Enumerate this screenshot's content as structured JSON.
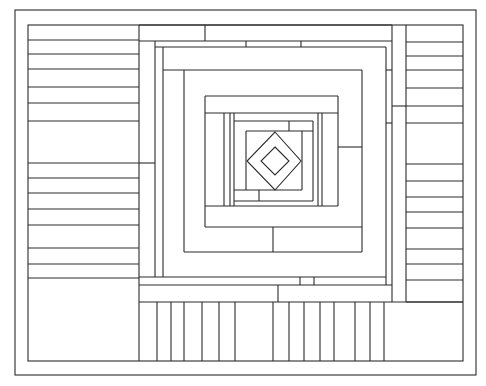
{
  "drawing": {
    "width": 486,
    "height": 386,
    "background": "#ffffff",
    "stroke": "#2a2a2a",
    "outer_border": {
      "x": 15,
      "y": 10,
      "w": 461,
      "h": 365
    },
    "inner_frame": {
      "x": 28,
      "y": 25,
      "w": 435,
      "h": 336
    },
    "left_panel": {
      "x1": 28,
      "x2": 139,
      "lines_y": [
        40,
        54,
        69,
        87,
        103,
        121,
        163,
        178,
        193,
        209,
        225,
        248,
        264,
        278
      ]
    },
    "right_panel": {
      "x1": 406,
      "x2": 463,
      "lines_y": [
        42,
        56,
        70,
        88,
        106,
        123,
        164,
        181,
        197,
        212,
        228,
        249,
        264,
        280,
        302
      ]
    },
    "bottom_panel": {
      "y1": 302,
      "y2": 361,
      "bars_x": [
        139,
        157,
        171,
        184,
        202,
        219,
        235,
        273,
        289,
        304,
        320,
        334,
        355,
        370,
        384
      ]
    },
    "diamonds": [
      {
        "name": "outer-diamond",
        "points": "275,132 301,161 275,190 247,161"
      },
      {
        "name": "inner-diamond",
        "points": "275,147 289,161 275,175 261,161"
      }
    ],
    "lines": [
      [
        139,
        25,
        139,
        302
      ],
      [
        139,
        25,
        392,
        25
      ],
      [
        139,
        41,
        392,
        41
      ],
      [
        205,
        25,
        205,
        41
      ],
      [
        155,
        41,
        155,
        277
      ],
      [
        139,
        163,
        155,
        163
      ],
      [
        155,
        47,
        386,
        47
      ],
      [
        246,
        41,
        246,
        47
      ],
      [
        301,
        41,
        301,
        47
      ],
      [
        392,
        25,
        392,
        302
      ],
      [
        406,
        25,
        406,
        302
      ],
      [
        392,
        106,
        406,
        106
      ],
      [
        386,
        47,
        386,
        285
      ],
      [
        386,
        70,
        392,
        70
      ],
      [
        386,
        123,
        392,
        123
      ],
      [
        163,
        47,
        163,
        277
      ],
      [
        163,
        70,
        362,
        70
      ],
      [
        184,
        70,
        184,
        252
      ],
      [
        362,
        70,
        362,
        252
      ],
      [
        184,
        252,
        362,
        252
      ],
      [
        273,
        227,
        273,
        252
      ],
      [
        205,
        96,
        338,
        96
      ],
      [
        205,
        96,
        205,
        227
      ],
      [
        205,
        113,
        338,
        113
      ],
      [
        338,
        96,
        338,
        206
      ],
      [
        338,
        147,
        362,
        147
      ],
      [
        205,
        227,
        362,
        227
      ],
      [
        205,
        206,
        338,
        206
      ],
      [
        224,
        113,
        224,
        206
      ],
      [
        230,
        113,
        230,
        206
      ],
      [
        234,
        113,
        234,
        206
      ],
      [
        318,
        113,
        318,
        206
      ],
      [
        322,
        113,
        322,
        206
      ],
      [
        234,
        121,
        313,
        121
      ],
      [
        313,
        121,
        313,
        201
      ],
      [
        289,
        121,
        289,
        131
      ],
      [
        246,
        131,
        313,
        131
      ],
      [
        246,
        131,
        246,
        190
      ],
      [
        302,
        131,
        302,
        190
      ],
      [
        234,
        190,
        302,
        190
      ],
      [
        259,
        190,
        259,
        201
      ],
      [
        234,
        201,
        313,
        201
      ],
      [
        139,
        277,
        386,
        277
      ],
      [
        300,
        277,
        300,
        285
      ],
      [
        314,
        277,
        314,
        285
      ],
      [
        139,
        285,
        392,
        285
      ],
      [
        278,
        285,
        278,
        302
      ],
      [
        139,
        302,
        463,
        302
      ]
    ]
  }
}
